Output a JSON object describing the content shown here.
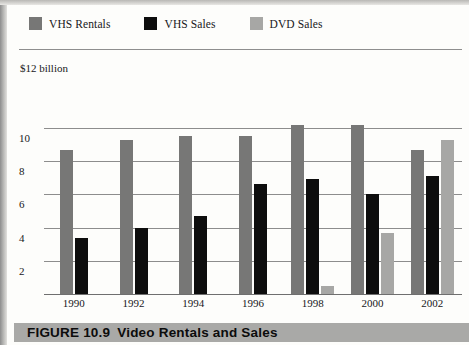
{
  "figure": {
    "caption_number": "FIGURE 10.9",
    "caption_title": "Video Rentals and Sales",
    "axis_unit_label": "$12 billion"
  },
  "legend": {
    "items": [
      {
        "label": "VHS Rentals",
        "color": "#777776",
        "key": "rentals"
      },
      {
        "label": "VHS Sales",
        "color": "#0d0d0d",
        "key": "vhssales"
      },
      {
        "label": "DVD Sales",
        "color": "#a7a7a5",
        "key": "dvdsales"
      }
    ]
  },
  "chart_data": {
    "type": "bar",
    "title": "Video Rentals and Sales",
    "xlabel": "",
    "ylabel": "$12 billion",
    "ylim": [
      0,
      12
    ],
    "yticks": [
      2,
      4,
      6,
      8,
      10
    ],
    "ytick_labels": [
      "2",
      "4",
      "6",
      "8",
      "10"
    ],
    "grid": true,
    "legend_position": "top-left",
    "categories": [
      "1990",
      "1992",
      "1994",
      "1996",
      "1998",
      "2000",
      "2002"
    ],
    "series": [
      {
        "name": "VHS Rentals",
        "color": "#777776",
        "values": [
          8.7,
          9.3,
          9.5,
          9.5,
          10.2,
          10.2,
          8.7
        ]
      },
      {
        "name": "VHS Sales",
        "color": "#0d0d0d",
        "values": [
          3.4,
          4.0,
          4.7,
          6.6,
          6.9,
          6.0,
          7.1
        ]
      },
      {
        "name": "DVD Sales",
        "color": "#a7a7a5",
        "values": [
          0,
          0,
          0,
          0,
          0.5,
          3.7,
          9.3
        ]
      }
    ]
  }
}
